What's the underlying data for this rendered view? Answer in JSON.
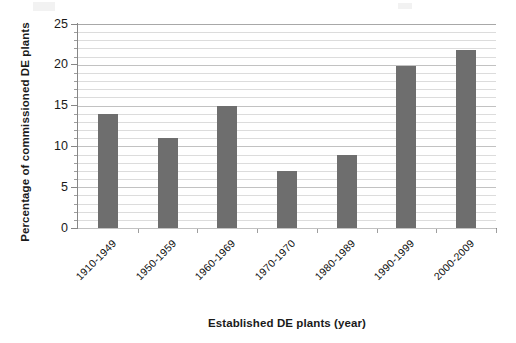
{
  "chart_data": {
    "type": "bar",
    "title": "",
    "xlabel": "Established DE plants (year)",
    "ylabel": "Percentage of commissioned DE plants",
    "categories": [
      "1910-1949",
      "1950-1959",
      "1960-1969",
      "1970-1970",
      "1980-1989",
      "1990-1999",
      "2000-2009"
    ],
    "values": [
      14,
      11,
      15,
      7,
      9,
      19.8,
      21.8
    ],
    "series": [
      {
        "name": "Percentage of commissioned DE plants",
        "values": [
          14,
          11,
          15,
          7,
          9,
          19.8,
          21.8
        ]
      }
    ],
    "ylim": [
      0,
      25
    ],
    "ytick_labels": [
      "0",
      "5",
      "10",
      "15",
      "20",
      "25"
    ],
    "ytick_values": [
      0,
      5,
      10,
      15,
      20,
      25
    ],
    "minor_tick_step": 1,
    "grid": true,
    "grid_axis": "y",
    "legend": false,
    "legend_position": "none",
    "bar_color": "#6e6e6e",
    "grid_color": "#dcdcdc",
    "axis_color": "#878787",
    "background_color": "#ffffff",
    "xtick_label_rotation": -45
  }
}
